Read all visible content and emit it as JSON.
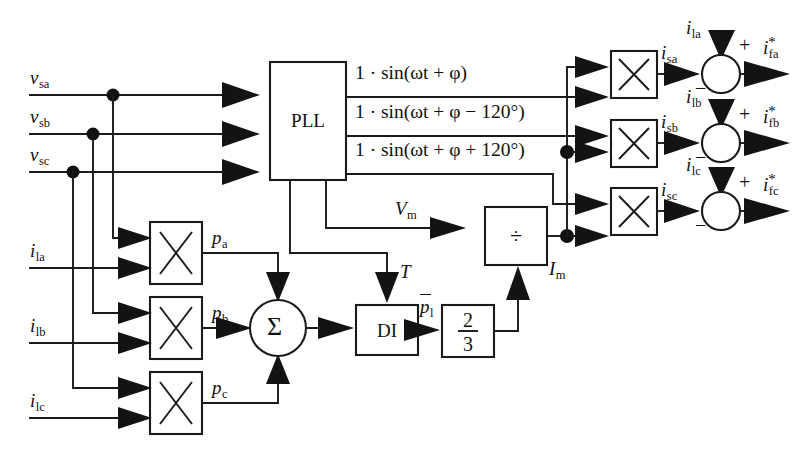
{
  "diagram": {
    "background_color": "#ffffff",
    "line_color": "#1a1a1a",
    "inputs": {
      "voltages": [
        {
          "id": "vsa",
          "base": "v",
          "sub": "sa"
        },
        {
          "id": "vsb",
          "base": "v",
          "sub": "sb"
        },
        {
          "id": "vsc",
          "base": "v",
          "sub": "sc"
        }
      ],
      "currents": [
        {
          "id": "ila",
          "base": "i",
          "sub": "la"
        },
        {
          "id": "ilb",
          "base": "i",
          "sub": "lb"
        },
        {
          "id": "ilc",
          "base": "i",
          "sub": "lc"
        }
      ]
    },
    "blocks": {
      "pll": {
        "label": "PLL"
      },
      "di": {
        "label": "DI"
      },
      "divider": {
        "label": "÷"
      },
      "two_thirds": {
        "numerator": "2",
        "denominator": "3"
      },
      "sigma": {
        "label": "Σ"
      },
      "multiplier_glyph": "×"
    },
    "pll_outputs": [
      {
        "id": "pll-out-a",
        "text": "1 · sin(ωt + φ)"
      },
      {
        "id": "pll-out-b",
        "text": "1 · sin(ωt + φ − 120°)"
      },
      {
        "id": "pll-out-c",
        "text": "1 · sin(ωt + φ + 120°)"
      }
    ],
    "intermediate_signals": [
      {
        "id": "pa",
        "base": "p",
        "sub": "a"
      },
      {
        "id": "pb",
        "base": "p",
        "sub": "b"
      },
      {
        "id": "pc",
        "base": "p",
        "sub": "c"
      },
      {
        "id": "T",
        "base": "T",
        "sub": ""
      },
      {
        "id": "pl_bar",
        "base": "p",
        "sub": "l",
        "overbar": true
      },
      {
        "id": "Vm",
        "base": "V",
        "sub": "m"
      },
      {
        "id": "Im",
        "base": "I",
        "sub": "m"
      }
    ],
    "source_currents": [
      {
        "id": "isa",
        "base": "i",
        "sub": "sa"
      },
      {
        "id": "isb",
        "base": "i",
        "sub": "sb"
      },
      {
        "id": "isc",
        "base": "i",
        "sub": "sc"
      }
    ],
    "summers": [
      {
        "id": "summer-a",
        "top_input": {
          "base": "i",
          "sub": "la"
        },
        "top_sign": "+",
        "left_sign": "−",
        "left_input": {
          "base": "i",
          "sub": "sa"
        },
        "output": {
          "base": "i",
          "sub": "fa",
          "star": "*"
        }
      },
      {
        "id": "summer-b",
        "top_input": {
          "base": "i",
          "sub": "lb"
        },
        "top_sign": "+",
        "left_sign": "−",
        "left_input": {
          "base": "i",
          "sub": "sb"
        },
        "output": {
          "base": "i",
          "sub": "fb",
          "star": "*"
        }
      },
      {
        "id": "summer-c",
        "top_input": {
          "base": "i",
          "sub": "lc"
        },
        "top_sign": "+",
        "left_sign": "−",
        "left_input": {
          "base": "i",
          "sub": "sc"
        },
        "output": {
          "base": "i",
          "sub": "fc",
          "star": "*"
        }
      }
    ]
  }
}
